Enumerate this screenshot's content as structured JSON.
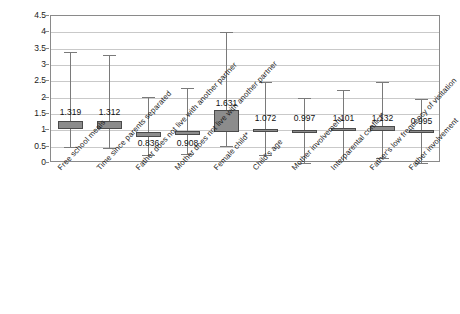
{
  "chart_data": {
    "type": "box",
    "title": "",
    "xlabel": "",
    "ylabel": "",
    "ylim": [
      0,
      4.5
    ],
    "ytick_step": 0.5,
    "grid": true,
    "legend": "none",
    "yticks": [
      "0",
      "0.5",
      "1",
      "1.5",
      "2",
      "2.5",
      "3",
      "3.5",
      "4",
      "4.5"
    ],
    "categories": [
      "Free school meals",
      "Time since parents separated",
      "Father does not live with another partner",
      "Mother does not live with another partner",
      "Female child*",
      "Child's age",
      "Mother involvement",
      "Interparental conflict*",
      "Father's low frequency of visitation",
      "Father involvement"
    ],
    "points": [
      {
        "label": "1.319",
        "value": 1.319,
        "box_low": 1.05,
        "box_high": 1.3,
        "whisker_low": 0.49,
        "whisker_high": 3.39,
        "label_value": 1.55
      },
      {
        "label": "1.312",
        "value": 1.312,
        "box_low": 1.05,
        "box_high": 1.3,
        "whisker_low": 0.46,
        "whisker_high": 3.3,
        "label_value": 1.55
      },
      {
        "label": "0.836",
        "value": 0.836,
        "box_low": 0.8,
        "box_high": 0.95,
        "whisker_low": 0.25,
        "whisker_high": 2.03,
        "label_value": 0.6
      },
      {
        "label": "0.908",
        "value": 0.908,
        "box_low": 0.86,
        "box_high": 0.97,
        "whisker_low": 0.28,
        "whisker_high": 2.3,
        "label_value": 0.6
      },
      {
        "label": "1.631",
        "value": 1.631,
        "box_low": 0.95,
        "box_high": 1.62,
        "whisker_low": 0.51,
        "whisker_high": 4.0,
        "label_value": 1.83
      },
      {
        "label": "1.072",
        "value": 1.072,
        "box_low": 0.97,
        "box_high": 1.04,
        "whisker_low": 0.23,
        "whisker_high": 2.47,
        "label_value": 1.38
      },
      {
        "label": "0.997",
        "value": 0.997,
        "box_low": 0.99,
        "box_high": 1.0,
        "whisker_low": 0.0,
        "whisker_high": 2.0,
        "label_value": 1.38
      },
      {
        "label": "1.101",
        "value": 1.101,
        "box_low": 0.98,
        "box_high": 1.07,
        "whisker_low": 0.06,
        "whisker_high": 2.23,
        "label_value": 1.38
      },
      {
        "label": "1.132",
        "value": 1.132,
        "box_low": 0.99,
        "box_high": 1.12,
        "whisker_low": 0.16,
        "whisker_high": 2.47,
        "label_value": 1.38
      },
      {
        "label": "0.995",
        "value": 0.995,
        "box_low": 0.99,
        "box_high": 1.0,
        "whisker_low": 0.0,
        "whisker_high": 1.96,
        "label_value": 1.28
      }
    ]
  }
}
